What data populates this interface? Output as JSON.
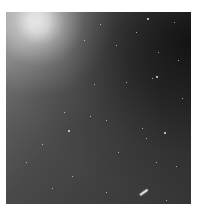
{
  "image": {
    "description": "Grayscale astronomical star field with a bright diffuse glow in the upper-left and a short bright streak near the lower-right",
    "palette": {
      "glow": "#ffffff",
      "field_light": "#8a8a8a",
      "field_mid": "#4a4a4a",
      "field_dark": "#1a1a1a",
      "background": "#ffffff"
    }
  }
}
